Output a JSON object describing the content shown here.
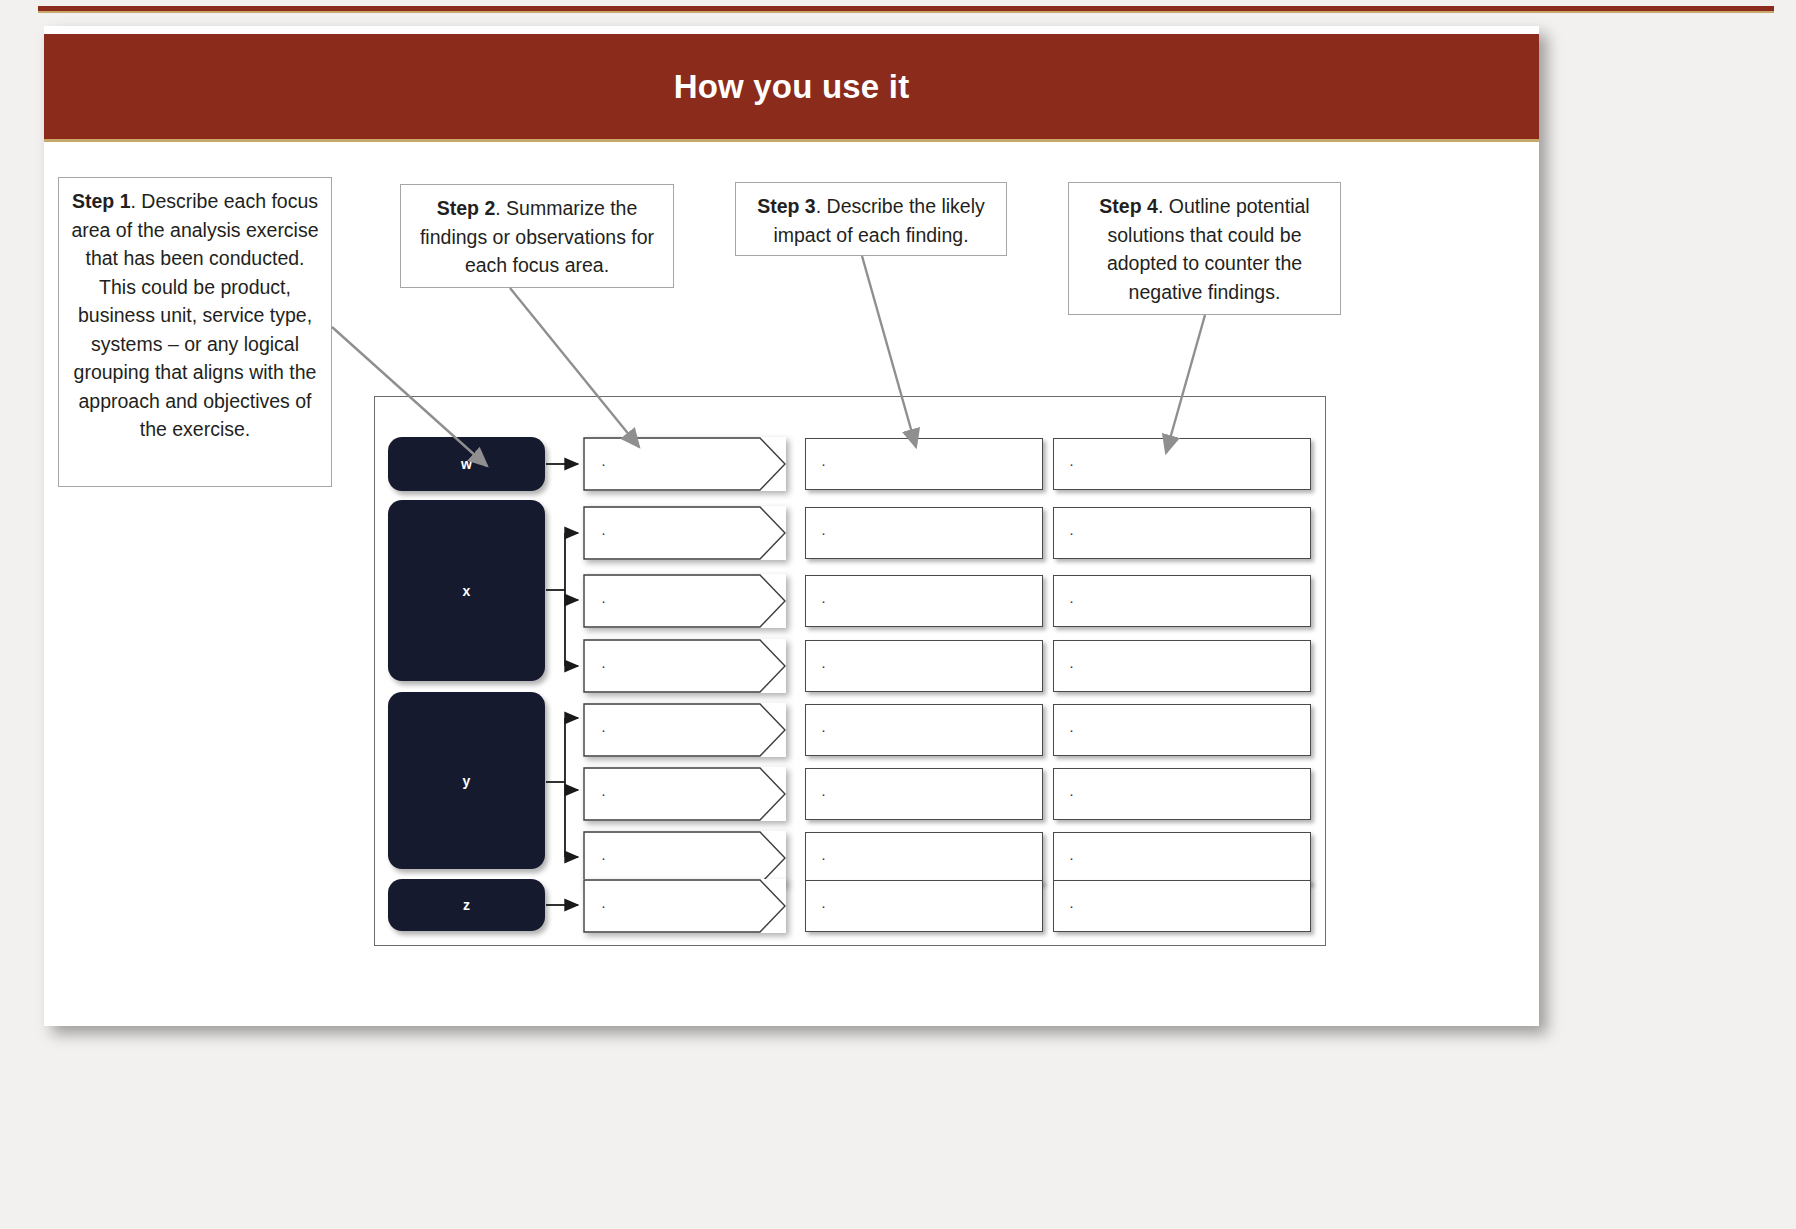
{
  "slide": {
    "title": "How you use it"
  },
  "callouts": [
    {
      "id": "step-1",
      "step": "Step 1",
      "text": ". Describe each focus area of the analysis exercise that has been conducted. This could be product, business unit, service type, systems – or any logical grouping that aligns with the approach and objectives of the exercise."
    },
    {
      "id": "step-2",
      "step": "Step 2",
      "text": ". Summarize the findings or observations for each focus area."
    },
    {
      "id": "step-3",
      "step": "Step 3",
      "text": ". Describe the likely impact of each finding."
    },
    {
      "id": "step-4",
      "step": "Step 4",
      "text": ". Outline potential solutions that could be adopted to counter the negative findings."
    }
  ],
  "diagram": {
    "columns": [
      {
        "label": "Focus Area"
      },
      {
        "label": "Findings"
      },
      {
        "label": "Impact"
      },
      {
        "label": "Potential Solutions"
      }
    ],
    "focus_areas": [
      {
        "label": "w",
        "rows": 1
      },
      {
        "label": "x",
        "rows": 3
      },
      {
        "label": "y",
        "rows": 3
      },
      {
        "label": "z",
        "rows": 1
      }
    ],
    "cell_bullet": "·",
    "rows": [
      {
        "focus": "w",
        "finding": "·",
        "impact": "·",
        "solution": "·"
      },
      {
        "focus": "x",
        "finding": "·",
        "impact": "·",
        "solution": "·"
      },
      {
        "focus": "x",
        "finding": "·",
        "impact": "·",
        "solution": "·"
      },
      {
        "focus": "x",
        "finding": "·",
        "impact": "·",
        "solution": "·"
      },
      {
        "focus": "y",
        "finding": "·",
        "impact": "·",
        "solution": "·"
      },
      {
        "focus": "y",
        "finding": "·",
        "impact": "·",
        "solution": "·"
      },
      {
        "focus": "y",
        "finding": "·",
        "impact": "·",
        "solution": "·"
      },
      {
        "focus": "z",
        "finding": "·",
        "impact": "·",
        "solution": "·"
      }
    ]
  },
  "colors": {
    "banner": "#8a2b1c",
    "banner_accent": "#c7a86b",
    "focus_block": "#161a2e",
    "header_text": "#1f2244",
    "connector": "#8f8f8f"
  }
}
